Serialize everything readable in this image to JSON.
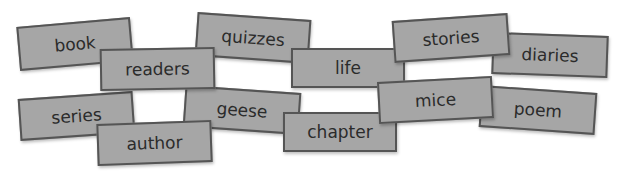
{
  "cards": [
    {
      "word": "book",
      "left": 18,
      "top": 22,
      "width": 114,
      "height": 44,
      "rotate": -5,
      "z": 1
    },
    {
      "word": "quizzes",
      "left": 196,
      "top": 16,
      "width": 114,
      "height": 44,
      "rotate": 4,
      "z": 1
    },
    {
      "word": "readers",
      "left": 100,
      "top": 48,
      "width": 115,
      "height": 42,
      "rotate": -1,
      "z": 2
    },
    {
      "word": "life",
      "left": 291,
      "top": 48,
      "width": 114,
      "height": 40,
      "rotate": 0,
      "z": 2
    },
    {
      "word": "stories",
      "left": 393,
      "top": 17,
      "width": 116,
      "height": 42,
      "rotate": -4,
      "z": 3
    },
    {
      "word": "diaries",
      "left": 492,
      "top": 34,
      "width": 116,
      "height": 42,
      "rotate": 2,
      "z": 2
    },
    {
      "word": "series",
      "left": 19,
      "top": 95,
      "width": 115,
      "height": 42,
      "rotate": -4,
      "z": 1
    },
    {
      "word": "geese",
      "left": 184,
      "top": 89,
      "width": 116,
      "height": 42,
      "rotate": 4,
      "z": 1
    },
    {
      "word": "author",
      "left": 97,
      "top": 122,
      "width": 115,
      "height": 42,
      "rotate": -2,
      "z": 3
    },
    {
      "word": "chapter",
      "left": 283,
      "top": 112,
      "width": 114,
      "height": 40,
      "rotate": 0,
      "z": 3
    },
    {
      "word": "mice",
      "left": 378,
      "top": 79,
      "width": 115,
      "height": 42,
      "rotate": -3,
      "z": 4
    },
    {
      "word": "poem",
      "left": 480,
      "top": 89,
      "width": 116,
      "height": 42,
      "rotate": 4,
      "z": 2
    }
  ]
}
